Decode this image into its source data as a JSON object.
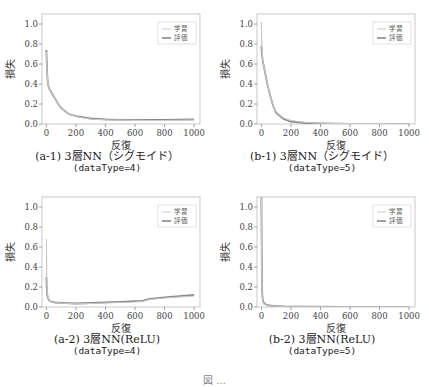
{
  "figure_caption": "図 ...",
  "chart_data": [
    {
      "id": "a1",
      "type": "line",
      "caption": "(a-1) 3層NN（シグモイド）",
      "subcaption": "(dataType=4)",
      "xlabel": "反復",
      "ylabel": "損失",
      "xlim": [
        -30,
        1040
      ],
      "ylim": [
        0,
        1.1
      ],
      "xticks": [
        0,
        200,
        400,
        600,
        800,
        1000
      ],
      "yticks": [
        "0.0",
        "0.2",
        "0.4",
        "0.6",
        "0.8",
        "1.0"
      ],
      "legend": {
        "position": "top-right",
        "entries": [
          "学習",
          "評価"
        ]
      },
      "series": [
        {
          "name": "学習",
          "color": "#c8c8c8",
          "x": [
            0,
            5,
            10,
            20,
            40,
            60,
            80,
            100,
            150,
            200,
            300,
            400,
            500,
            600,
            700,
            800,
            900,
            1000
          ],
          "y": [
            0.72,
            0.5,
            0.4,
            0.35,
            0.3,
            0.25,
            0.2,
            0.16,
            0.1,
            0.075,
            0.05,
            0.042,
            0.038,
            0.036,
            0.035,
            0.035,
            0.036,
            0.038
          ]
        },
        {
          "name": "評価",
          "color": "#888888",
          "x": [
            0,
            5,
            10,
            20,
            40,
            60,
            80,
            100,
            150,
            200,
            300,
            400,
            500,
            600,
            700,
            800,
            900,
            1000
          ],
          "y": [
            0.74,
            0.5,
            0.4,
            0.35,
            0.3,
            0.25,
            0.2,
            0.16,
            0.1,
            0.078,
            0.055,
            0.046,
            0.042,
            0.04,
            0.04,
            0.041,
            0.043,
            0.046
          ]
        }
      ]
    },
    {
      "id": "b1",
      "type": "line",
      "caption": "(b-1) 3層NN（シグモイド）",
      "subcaption": "(dataType=5)",
      "xlabel": "反復",
      "ylabel": "損失",
      "xlim": [
        -30,
        1040
      ],
      "ylim": [
        0,
        1.1
      ],
      "xticks": [
        0,
        200,
        400,
        600,
        800,
        1000
      ],
      "yticks": [
        "0.0",
        "0.2",
        "0.4",
        "0.6",
        "0.8",
        "1.0"
      ],
      "legend": {
        "position": "top-right",
        "entries": [
          "学習",
          "評価"
        ]
      },
      "series": [
        {
          "name": "学習",
          "color": "#c8c8c8",
          "x": [
            0,
            2,
            5,
            10,
            20,
            40,
            60,
            80,
            100,
            150,
            200,
            300,
            400,
            500,
            600,
            800,
            1000
          ],
          "y": [
            1.02,
            0.8,
            0.7,
            0.62,
            0.55,
            0.4,
            0.28,
            0.18,
            0.12,
            0.06,
            0.035,
            0.015,
            0.008,
            0.005,
            0.004,
            0.003,
            0.002
          ]
        },
        {
          "name": "評価",
          "color": "#888888",
          "x": [
            0,
            2,
            5,
            10,
            20,
            40,
            60,
            80,
            100,
            150,
            200,
            300,
            400,
            500,
            600,
            800,
            1000
          ],
          "y": [
            0.78,
            0.72,
            0.68,
            0.62,
            0.55,
            0.4,
            0.28,
            0.18,
            0.11,
            0.05,
            0.025,
            0.01,
            0.005,
            0.003,
            0.002,
            0.002,
            0.001
          ]
        }
      ]
    },
    {
      "id": "a2",
      "type": "line",
      "caption": "(a-2) 3層NN(ReLU)",
      "subcaption": "(dataType=4)",
      "xlabel": "反復",
      "ylabel": "損失",
      "xlim": [
        -30,
        1040
      ],
      "ylim": [
        0,
        1.1
      ],
      "xticks": [
        0,
        200,
        400,
        600,
        800,
        1000
      ],
      "yticks": [
        "0.0",
        "0.2",
        "0.4",
        "0.6",
        "0.8",
        "1.0"
      ],
      "legend": {
        "position": "top-right",
        "entries": [
          "学習",
          "評価"
        ]
      },
      "series": [
        {
          "name": "学習",
          "color": "#c8c8c8",
          "x": [
            0,
            2,
            5,
            10,
            20,
            40,
            60,
            100,
            200,
            300,
            400,
            500,
            600,
            650,
            700,
            800,
            900,
            1000
          ],
          "y": [
            0.68,
            0.3,
            0.15,
            0.1,
            0.07,
            0.05,
            0.045,
            0.04,
            0.032,
            0.035,
            0.04,
            0.045,
            0.05,
            0.055,
            0.075,
            0.09,
            0.1,
            0.11
          ]
        },
        {
          "name": "評価",
          "color": "#888888",
          "x": [
            0,
            2,
            5,
            10,
            20,
            40,
            60,
            100,
            200,
            300,
            400,
            500,
            600,
            650,
            700,
            800,
            900,
            1000
          ],
          "y": [
            0.3,
            0.2,
            0.12,
            0.09,
            0.065,
            0.05,
            0.045,
            0.042,
            0.035,
            0.04,
            0.046,
            0.052,
            0.058,
            0.062,
            0.082,
            0.097,
            0.108,
            0.12
          ]
        }
      ]
    },
    {
      "id": "b2",
      "type": "line",
      "caption": "(b-2) 3層NN(ReLU)",
      "subcaption": "(dataType=5)",
      "xlabel": "反復",
      "ylabel": "損失",
      "xlim": [
        -30,
        1040
      ],
      "ylim": [
        0,
        1.1
      ],
      "xticks": [
        0,
        200,
        400,
        600,
        800,
        1000
      ],
      "yticks": [
        "0.0",
        "0.2",
        "0.4",
        "0.6",
        "0.8",
        "1.0"
      ],
      "legend": {
        "position": "top-right",
        "entries": [
          "学習",
          "評価"
        ]
      },
      "series": [
        {
          "name": "学習",
          "color": "#c8c8c8",
          "x": [
            0,
            2,
            4,
            6,
            10,
            20,
            40,
            80,
            150,
            300,
            600,
            1000
          ],
          "y": [
            1.1,
            0.4,
            0.2,
            0.1,
            0.05,
            0.03,
            0.015,
            0.008,
            0.004,
            0.002,
            0.001,
            0.001
          ]
        },
        {
          "name": "評価",
          "color": "#888888",
          "x": [
            0,
            2,
            4,
            6,
            10,
            20,
            40,
            80,
            150,
            300,
            600,
            1000
          ],
          "y": [
            1.1,
            0.6,
            0.25,
            0.12,
            0.06,
            0.035,
            0.018,
            0.01,
            0.005,
            0.003,
            0.002,
            0.001
          ]
        }
      ]
    }
  ]
}
